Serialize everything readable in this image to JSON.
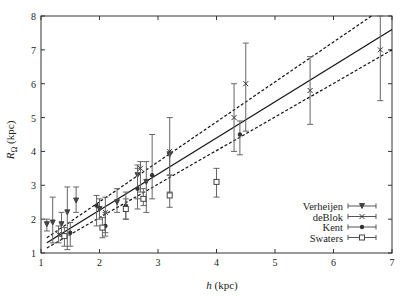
{
  "chart_data": {
    "type": "scatter",
    "title": "",
    "xlabel": "h (kpc)",
    "ylabel": "R_Ω (kpc)",
    "xlim": [
      1,
      7
    ],
    "ylim": [
      1,
      8
    ],
    "xticks": [
      1,
      2,
      3,
      4,
      5,
      6,
      7
    ],
    "yticks": [
      1,
      2,
      3,
      4,
      5,
      6,
      7,
      8
    ],
    "grid": false,
    "legend_position": "lower right",
    "series": [
      {
        "name": "Verheijen",
        "marker": "triangle-down",
        "points": [
          {
            "x": 1.1,
            "y": 1.85,
            "lo": 1.65,
            "hi": 2.0
          },
          {
            "x": 1.2,
            "y": 1.9,
            "lo": 1.3,
            "hi": 2.65
          },
          {
            "x": 1.35,
            "y": 1.85,
            "lo": 1.5,
            "hi": 2.2
          },
          {
            "x": 1.45,
            "y": 2.2,
            "lo": 1.1,
            "hi": 2.95
          },
          {
            "x": 1.6,
            "y": 2.55,
            "lo": 2.2,
            "hi": 2.95
          },
          {
            "x": 2.0,
            "y": 2.3,
            "lo": 2.0,
            "hi": 2.6
          },
          {
            "x": 2.3,
            "y": 2.5,
            "lo": 2.2,
            "hi": 2.9
          },
          {
            "x": 2.65,
            "y": 3.3,
            "lo": 2.6,
            "hi": 3.6
          },
          {
            "x": 2.8,
            "y": 3.1,
            "lo": 2.2,
            "hi": 3.7
          },
          {
            "x": 3.2,
            "y": 3.9,
            "lo": 3.3,
            "hi": 4.0
          }
        ]
      },
      {
        "name": "deBlok",
        "marker": "x",
        "points": [
          {
            "x": 1.3,
            "y": 1.55,
            "lo": 1.3,
            "hi": 1.8
          },
          {
            "x": 2.1,
            "y": 2.2,
            "lo": 1.6,
            "hi": 2.65
          },
          {
            "x": 2.7,
            "y": 3.5,
            "lo": 2.8,
            "hi": 3.7
          },
          {
            "x": 3.2,
            "y": 4.0,
            "lo": 2.8,
            "hi": 5.0
          },
          {
            "x": 4.3,
            "y": 5.0,
            "lo": 4.0,
            "hi": 6.0
          },
          {
            "x": 4.5,
            "y": 6.0,
            "lo": 4.6,
            "hi": 7.2
          },
          {
            "x": 5.6,
            "y": 5.8,
            "lo": 4.8,
            "hi": 6.8
          },
          {
            "x": 6.8,
            "y": 7.0,
            "lo": 5.5,
            "hi": 8.0
          }
        ]
      },
      {
        "name": "Kent",
        "marker": "circle",
        "points": [
          {
            "x": 1.5,
            "y": 1.6,
            "lo": 1.2,
            "hi": 1.9
          },
          {
            "x": 1.95,
            "y": 2.4,
            "lo": 1.8,
            "hi": 2.7
          },
          {
            "x": 2.1,
            "y": 1.8,
            "lo": 1.5,
            "hi": 2.2
          },
          {
            "x": 2.45,
            "y": 2.4,
            "lo": 2.0,
            "hi": 2.8
          },
          {
            "x": 2.65,
            "y": 2.9,
            "lo": 2.3,
            "hi": 3.5
          },
          {
            "x": 2.9,
            "y": 3.3,
            "lo": 2.6,
            "hi": 4.5
          },
          {
            "x": 4.4,
            "y": 4.5,
            "lo": 3.9,
            "hi": 4.9
          }
        ]
      },
      {
        "name": "Swaters",
        "marker": "square",
        "points": [
          {
            "x": 1.4,
            "y": 1.5,
            "lo": 1.2,
            "hi": 1.75
          },
          {
            "x": 2.05,
            "y": 1.75,
            "lo": 1.45,
            "hi": 2.05
          },
          {
            "x": 2.45,
            "y": 2.3,
            "lo": 2.0,
            "hi": 2.6
          },
          {
            "x": 2.75,
            "y": 2.6,
            "lo": 2.4,
            "hi": 2.9
          },
          {
            "x": 3.2,
            "y": 2.7,
            "lo": 2.35,
            "hi": 3.3
          },
          {
            "x": 4.0,
            "y": 3.1,
            "lo": 2.65,
            "hi": 3.5
          }
        ]
      }
    ],
    "fit_lines": [
      {
        "name": "best-fit",
        "style": "solid",
        "x": [
          1.1,
          7.0
        ],
        "y": [
          1.3,
          7.6
        ]
      },
      {
        "name": "upper-bound",
        "style": "dashed",
        "x": [
          1.1,
          6.65
        ],
        "y": [
          1.45,
          8.0
        ]
      },
      {
        "name": "lower-bound",
        "style": "dashed",
        "x": [
          1.1,
          7.0
        ],
        "y": [
          1.15,
          7.0
        ]
      }
    ]
  },
  "legend": {
    "entries": [
      "Verheijen",
      "deBlok",
      "Kent",
      "Swaters"
    ]
  },
  "axes": {
    "xlabel_italic": "h",
    "xlabel_unit": " (kpc)",
    "ylabel_italic": "R",
    "ylabel_sub": "Ω",
    "ylabel_unit": " (kpc)"
  }
}
